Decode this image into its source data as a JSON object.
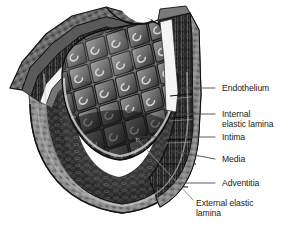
{
  "figure": {
    "type": "anatomical-illustration",
    "background_color": "#ffffff",
    "text_color": "#1a1a1a",
    "leader_line_color": "#4a4a4a",
    "palette": {
      "adventitia_gray": "#8e8e8e",
      "media_dark": "#2e2e2e",
      "intima_mid": "#565656",
      "elastic_lamina_white": "#f2f2f2",
      "endothelium_cell": "#6b6b6b",
      "outline_black": "#111111"
    }
  },
  "labels": [
    {
      "id": "endothelium",
      "name": "label-endothelium",
      "lines": [
        "Endothelium"
      ],
      "text_x": 222,
      "text_y": 84,
      "leader": {
        "x1": 215,
        "y1": 88,
        "x2": 182,
        "y2": 88,
        "style": "straight"
      }
    },
    {
      "id": "internal-elastic-lamina",
      "name": "label-internal-elastic-lamina",
      "lines": [
        "Internal",
        "elastic lamina"
      ],
      "text_x": 222,
      "text_y": 110,
      "leader": {
        "x1": 215,
        "y1": 114,
        "x2": 176,
        "y2": 114,
        "style": "straight"
      }
    },
    {
      "id": "intima",
      "name": "label-intima",
      "lines": [
        "Intima"
      ],
      "text_x": 222,
      "text_y": 133,
      "leader": {
        "x1": 215,
        "y1": 137,
        "x2": 139,
        "y2": 137,
        "style": "straight"
      }
    },
    {
      "id": "media",
      "name": "label-media",
      "lines": [
        "Media"
      ],
      "text_x": 222,
      "text_y": 155,
      "leader": {
        "x1": 215,
        "y1": 159,
        "x2": 172,
        "y2": 152,
        "style": "straight"
      }
    },
    {
      "id": "adventitia",
      "name": "label-adventitia",
      "lines": [
        "Adventitia"
      ],
      "text_x": 222,
      "text_y": 179,
      "leader": {
        "x1": 215,
        "y1": 183,
        "x2": 171,
        "y2": 183,
        "style": "straight"
      }
    },
    {
      "id": "external-elastic-lamina",
      "name": "label-external-elastic-lamina",
      "lines": [
        "External elastic",
        "lamina"
      ],
      "text_x": 196,
      "text_y": 201,
      "leader": {
        "x1": 193,
        "y1": 203,
        "x2": 135,
        "y2": 137,
        "style": "diagonal"
      }
    }
  ],
  "layers_depicted": [
    {
      "name": "Endothelium",
      "description": "innermost single cell layer, diamond-shaped cells lining the lumen"
    },
    {
      "name": "Internal elastic lamina",
      "description": "bright white band separating intima from media"
    },
    {
      "name": "Intima",
      "description": "inner coat beneath the endothelium"
    },
    {
      "name": "Media",
      "description": "thick middle smooth-muscle coat, dark striated texture"
    },
    {
      "name": "Adventitia",
      "description": "outer fibrous coat, light gray mottled texture"
    },
    {
      "name": "External elastic lamina",
      "description": "band separating media from adventitia"
    }
  ]
}
